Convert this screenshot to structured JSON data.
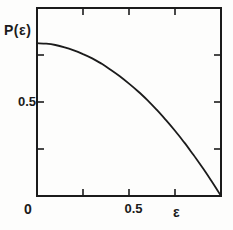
{
  "figure": {
    "background_color": "#fdfdfc",
    "ink_color": "#1b1b1b",
    "labels": {
      "y_axis_label": "P(ε)",
      "y_tick_label": "0.5",
      "origin_label": "0",
      "x_tick_label": "0.5",
      "x_axis_label": "ε"
    }
  },
  "chart_data": {
    "type": "line",
    "title": "",
    "xlabel": "ε",
    "ylabel": "P(ε)",
    "xlim": [
      0,
      1
    ],
    "ylim": [
      0,
      1
    ],
    "grid": false,
    "legend": "none",
    "frame": "box-with-inward-ticks",
    "x_tick_fractions": [
      0.25,
      0.5,
      0.75
    ],
    "y_tick_fractions": [
      0.25,
      0.5,
      0.75
    ],
    "labeled_ticks": {
      "x": [
        0,
        0.5
      ],
      "y": [
        0.5
      ]
    },
    "series": [
      {
        "name": "P(ε)",
        "x": [
          0,
          0.05,
          0.1,
          0.15,
          0.2,
          0.25,
          0.3,
          0.35,
          0.4,
          0.45,
          0.5,
          0.55,
          0.6,
          0.65,
          0.7,
          0.75,
          0.8,
          0.85,
          0.9,
          0.95,
          1.0
        ],
        "y": [
          0.813,
          0.81,
          0.803,
          0.791,
          0.775,
          0.755,
          0.732,
          0.704,
          0.672,
          0.637,
          0.598,
          0.556,
          0.51,
          0.459,
          0.405,
          0.347,
          0.285,
          0.219,
          0.15,
          0.077,
          0.0
        ]
      }
    ]
  }
}
